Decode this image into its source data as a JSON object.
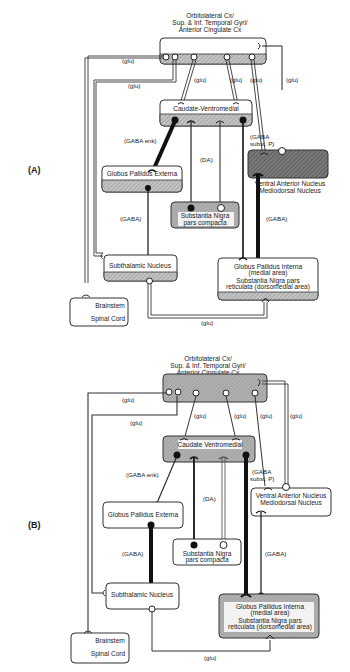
{
  "figure": {
    "panels": [
      {
        "id": "A",
        "label": "(A)",
        "nodes": {
          "cortex": {
            "line1": "Orbitolateral Cx/",
            "line2": "Sup. & Inf. Temporal Gyri/",
            "line3": "Anterior Cingulate Cx",
            "shaded": "bottom"
          },
          "caudate": {
            "label": "Caudate-Ventromedial",
            "shaded": "bottom"
          },
          "gpe": {
            "label": "Globus Pallidus Externa",
            "shaded": "bottom"
          },
          "snc": {
            "line1": "Substantia Nigra",
            "line2": "pars compacta",
            "shaded": "full"
          },
          "stn": {
            "label": "Subthalamic Nucleus",
            "shaded": "bottom"
          },
          "thalamus": {
            "line1": "Ventral Anterior Nucleus",
            "line2": "Mediodorsal Nucleus",
            "shaded": "dark-full"
          },
          "gpi": {
            "line1": "Globus Pallidus Interna",
            "line2": "(medial area)",
            "line3": "Substantia Nigra pars",
            "line4": "reticulata (dorsomedial area)",
            "shaded": "bottom"
          },
          "brainstem": {
            "line1": "Brainstem",
            "line2": "Spinal Cord"
          }
        },
        "edge_labels": {
          "glu_brainstem": "(glu)",
          "glu_stn": "(glu)",
          "glu_caud_left": "(glu)",
          "glu_caud_right": "(glu)",
          "glu_thal": "(glu)",
          "glu_cortex_back": "(glu)",
          "gaba_enk": "(GABA enk)",
          "da": "(DA)",
          "gaba_substp_1": "(GABA",
          "gaba_substp_2": "subst. P)",
          "gaba_gpe_stn": "(GABA)",
          "gaba_gpi_thal": "(GABA)",
          "glu_stn_gpi": "(glu)"
        }
      },
      {
        "id": "B",
        "label": "(B)",
        "nodes": {
          "cortex": {
            "line1": "Orbitolateral Cx/",
            "line2": "Sup. & Inf. Temporal Gyri/",
            "line3": "Anterior Cingulate Cx",
            "shaded": "full"
          },
          "caudate": {
            "label": "Caudate Ventromedial",
            "shaded": "full"
          },
          "gpe": {
            "label": "Globus Pallidus Externa",
            "shaded": "none"
          },
          "snc": {
            "line1": "Substantia Nigra",
            "line2": "pars compacta",
            "shaded": "none"
          },
          "stn": {
            "label": "Subthalamic Nucleus",
            "shaded": "none"
          },
          "thalamus": {
            "line1": "Ventral Anterior Nucleus",
            "line2": "Mediodorsal Nucleus",
            "shaded": "none"
          },
          "gpi": {
            "line1": "Globus Pallidus Interna",
            "line2": "(medial area)",
            "line3": "Substantia Nigra pars",
            "line4": "reticulata (dorsomedial area)",
            "shaded": "full"
          },
          "brainstem": {
            "line1": "Brainstem",
            "line2": "Spinal Cord"
          }
        },
        "edge_labels": {
          "glu_brainstem": "(glu)",
          "glu_stn": "(glu)",
          "glu_caud_left": "(glu)",
          "glu_caud_right": "(glu)",
          "glu_thal": "(glu)",
          "glu_cortex_back": "(glu)",
          "gaba_enk": "(GABA enk)",
          "da": "(DA)",
          "gaba_substp_1": "(GABA",
          "gaba_substp_2": "subst. P)",
          "gaba_gpe_stn": "(GABA)",
          "gaba_gpi_thal": "(GABA)",
          "glu_stn_gpi": "(glu)"
        }
      }
    ],
    "colors": {
      "line": "#1a1a1a",
      "shade": "#b8b8b8",
      "dark_shade": "#6e6e6e",
      "box_border": "#333333"
    }
  }
}
